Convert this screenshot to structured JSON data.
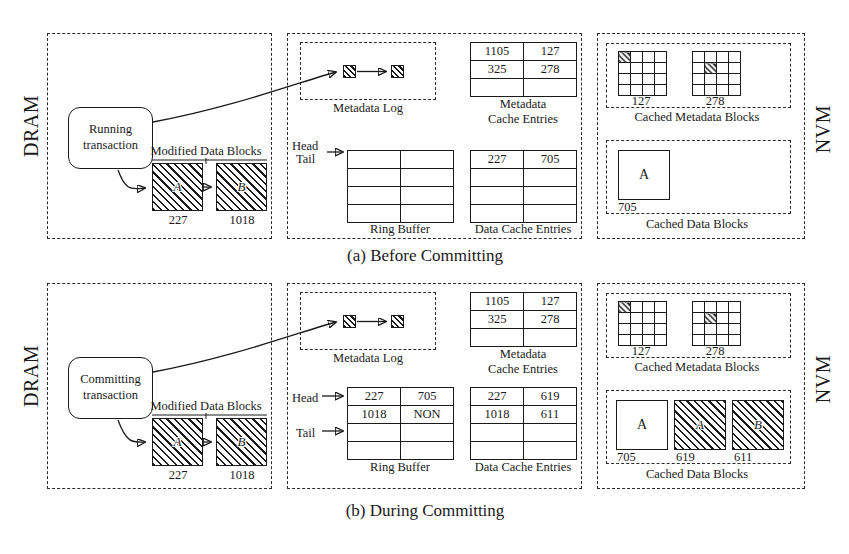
{
  "figure": {
    "memory_regions": {
      "dram_label": "DRAM",
      "nvm_label": "NVM"
    }
  },
  "subfigures": [
    {
      "caption": "(a) Before Committing",
      "transaction": {
        "line1": "Running",
        "line2": "transaction"
      },
      "modified_data_blocks": {
        "title": "Modified Data Blocks",
        "blocks": [
          {
            "glyph": "A",
            "id": "227"
          },
          {
            "glyph": "B",
            "id": "1018"
          }
        ]
      },
      "metadata_log": {
        "title": "Metadata Log",
        "entries": 2
      },
      "ring_buffer": {
        "title": "Ring Buffer",
        "head_label": "Head",
        "tail_label": "Tail",
        "rows": [
          [
            "",
            ""
          ],
          [
            "",
            ""
          ],
          [
            "",
            ""
          ],
          [
            "",
            ""
          ]
        ]
      },
      "metadata_cache_entries": {
        "title_line1": "Metadata",
        "title_line2": "Cache Entries",
        "rows": [
          [
            "1105",
            "127"
          ],
          [
            "325",
            "278"
          ],
          [
            "",
            ""
          ]
        ]
      },
      "data_cache_entries": {
        "title": "Data Cache Entries",
        "rows": [
          [
            "227",
            "705"
          ],
          [
            "",
            ""
          ],
          [
            "",
            ""
          ],
          [
            "",
            ""
          ]
        ]
      },
      "cached_metadata_blocks": {
        "title": "Cached Metadata Blocks",
        "blocks": [
          {
            "id": "127",
            "dirty_cell": [
              0,
              0
            ]
          },
          {
            "id": "278",
            "dirty_cell": [
              1,
              1
            ]
          }
        ]
      },
      "cached_data_blocks": {
        "title": "Cached Data Blocks",
        "blocks": [
          {
            "glyph": "A",
            "id": "705",
            "hatched": false
          }
        ]
      }
    },
    {
      "caption": "(b) During Committing",
      "transaction": {
        "line1": "Committing",
        "line2": "transaction"
      },
      "modified_data_blocks": {
        "title": "Modified Data Blocks",
        "blocks": [
          {
            "glyph": "A",
            "id": "227"
          },
          {
            "glyph": "B",
            "id": "1018"
          }
        ]
      },
      "metadata_log": {
        "title": "Metadata Log",
        "entries": 2
      },
      "ring_buffer": {
        "title": "Ring Buffer",
        "head_label": "Head",
        "tail_label": "Tail",
        "rows": [
          [
            "227",
            "705"
          ],
          [
            "1018",
            "NON"
          ],
          [
            "",
            ""
          ],
          [
            "",
            ""
          ]
        ]
      },
      "metadata_cache_entries": {
        "title_line1": "Metadata",
        "title_line2": "Cache Entries",
        "rows": [
          [
            "1105",
            "127"
          ],
          [
            "325",
            "278"
          ],
          [
            "",
            ""
          ]
        ]
      },
      "data_cache_entries": {
        "title": "Data Cache Entries",
        "rows": [
          [
            "227",
            "619"
          ],
          [
            "1018",
            "611"
          ],
          [
            "",
            ""
          ],
          [
            "",
            ""
          ]
        ]
      },
      "cached_metadata_blocks": {
        "title": "Cached Metadata Blocks",
        "blocks": [
          {
            "id": "127",
            "dirty_cell": [
              0,
              0
            ]
          },
          {
            "id": "278",
            "dirty_cell": [
              1,
              1
            ]
          }
        ]
      },
      "cached_data_blocks": {
        "title": "Cached Data Blocks",
        "blocks": [
          {
            "glyph": "A",
            "id": "705",
            "hatched": false
          },
          {
            "glyph": "A",
            "id": "619",
            "hatched": true
          },
          {
            "glyph": "B",
            "id": "611",
            "hatched": true
          }
        ]
      }
    }
  ],
  "colors": {
    "ink": "#1a1a1a",
    "background": "#ffffff"
  }
}
